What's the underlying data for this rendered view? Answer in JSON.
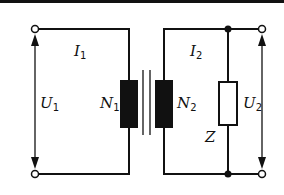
{
  "diagram": {
    "type": "transformer-circuit",
    "colors": {
      "line": "#111111",
      "background": "#ffffff",
      "coil_fill": "#111111",
      "impedance_fill": "#ffffff"
    },
    "labels": {
      "I1": {
        "main": "I",
        "sub": "1"
      },
      "I2": {
        "main": "I",
        "sub": "2"
      },
      "U1": {
        "main": "U",
        "sub": "1"
      },
      "U2": {
        "main": "U",
        "sub": "2"
      },
      "N1": {
        "main": "N",
        "sub": "1"
      },
      "N2": {
        "main": "N",
        "sub": "2"
      },
      "Z": {
        "main": "Z"
      }
    },
    "components": [
      {
        "id": "primary-coil",
        "label": "N1"
      },
      {
        "id": "core",
        "label": ""
      },
      {
        "id": "secondary-coil",
        "label": "N2"
      },
      {
        "id": "impedance",
        "label": "Z"
      }
    ]
  }
}
